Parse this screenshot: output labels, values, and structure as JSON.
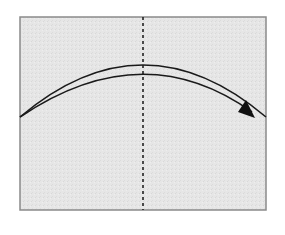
{
  "diagram": {
    "type": "origami-fold-instruction",
    "description": "Valley fold: fold the left half over to the right along the dashed center line",
    "paper": {
      "x": 20,
      "y": 17,
      "width": 246,
      "height": 193,
      "fill": "#e6e6e6",
      "stroke": "#8a8a8a"
    },
    "fold_line": {
      "style": "dashed",
      "x": 143,
      "y1": 17,
      "y2": 210,
      "color": "#222222"
    },
    "arrow": {
      "direction": "left-to-right",
      "color": "#1a1a1a",
      "outer_arc": {
        "start": [
          20,
          117
        ],
        "control": [
          143,
          13
        ],
        "end": [
          266,
          117
        ]
      },
      "inner_arc": {
        "start": [
          20,
          117
        ],
        "control": [
          143,
          34
        ],
        "end": [
          252,
          112
        ]
      },
      "head": [
        [
          238,
          112
        ],
        [
          255,
          118
        ],
        [
          246,
          100
        ]
      ]
    }
  }
}
